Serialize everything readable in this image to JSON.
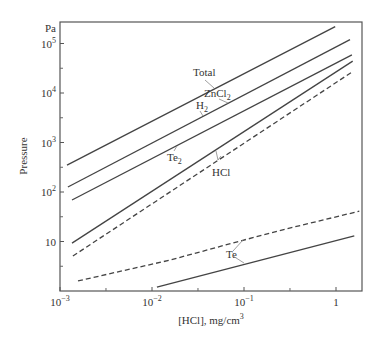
{
  "chart_data": {
    "type": "line",
    "title": "",
    "xlabel": "[HCl], mg/cm",
    "xlabel_sup": "3",
    "ylabel": "Pressure",
    "yunit": "Pa",
    "xscale": "log",
    "yscale": "log",
    "xlim": [
      0.001,
      1.8
    ],
    "ylim": [
      1,
      300000
    ],
    "grid": false,
    "legend": "none (inline annotations)",
    "x_ticks": [
      {
        "value": 0.001,
        "base": "10",
        "exp": "−3"
      },
      {
        "value": 0.01,
        "base": "10",
        "exp": "−2"
      },
      {
        "value": 0.1,
        "base": "10",
        "exp": "−1"
      },
      {
        "value": 1,
        "base": "1",
        "exp": ""
      }
    ],
    "x_minor_ticks": [
      0.00316,
      0.0316,
      0.316
    ],
    "y_ticks": [
      {
        "value": 10,
        "base": "10",
        "exp": ""
      },
      {
        "value": 100,
        "base": "10",
        "exp": "2"
      },
      {
        "value": 1000,
        "base": "10",
        "exp": "3"
      },
      {
        "value": 10000,
        "base": "10",
        "exp": "4"
      },
      {
        "value": 100000,
        "base": "10",
        "exp": "5"
      }
    ],
    "y_minor_ticks": [
      3.16,
      31.6,
      316,
      3162,
      31623
    ],
    "series": [
      {
        "name": "Total",
        "style": "solid",
        "x": [
          0.00119,
          0.98
        ],
        "y": [
          350,
          220000
        ]
      },
      {
        "name": "ZnCl2 / H2",
        "style": "solid",
        "x": [
          0.00122,
          1.42
        ],
        "y": [
          126,
          120000
        ]
      },
      {
        "name": "Te2",
        "style": "solid",
        "x": [
          0.00135,
          1.49
        ],
        "y": [
          69,
          59000
        ]
      },
      {
        "name": "HCl",
        "style": "solid",
        "x": [
          0.00135,
          1.52
        ],
        "y": [
          9.3,
          44000
        ]
      },
      {
        "name": "(dashed, unlabeled)",
        "style": "dashed",
        "x": [
          0.00138,
          1.52
        ],
        "y": [
          5.1,
          27000
        ]
      },
      {
        "name": "Te (dashed)",
        "style": "dashed",
        "x": [
          0.00157,
          0.0157,
          0.09,
          0.32,
          1.79
        ],
        "y": [
          1.6,
          4.2,
          10.2,
          18.8,
          41
        ]
      },
      {
        "name": "Te",
        "style": "solid",
        "x": [
          0.0113,
          1.58
        ],
        "y": [
          1.2,
          13
        ]
      }
    ],
    "annotations": [
      {
        "text": "Total",
        "sub": "",
        "x": 193,
        "y": 76,
        "leaders": [
          [
            205,
            80,
            214,
            88
          ]
        ]
      },
      {
        "text": "ZnCl",
        "sub": "2",
        "x": 204,
        "y": 97,
        "leaders": [
          [
            219,
            99,
            228,
            103
          ]
        ]
      },
      {
        "text": "H",
        "sub": "2",
        "x": 196,
        "y": 109,
        "leaders": [
          [
            200,
            111,
            203,
            116
          ]
        ]
      },
      {
        "text": "Te",
        "sub": "2",
        "x": 167,
        "y": 161,
        "leaders": [
          [
            174,
            151,
            177,
            146
          ]
        ]
      },
      {
        "text": "HCl",
        "sub": "",
        "x": 212,
        "y": 176,
        "leaders": [
          [
            216,
            151,
            218,
            160
          ],
          [
            218,
            160,
            221,
            156
          ]
        ]
      },
      {
        "text": "Te",
        "sub": "",
        "x": 226,
        "y": 258,
        "leaders": [
          [
            233,
            251,
            243,
            240
          ],
          [
            233,
            256,
            244,
            263
          ]
        ]
      }
    ]
  }
}
